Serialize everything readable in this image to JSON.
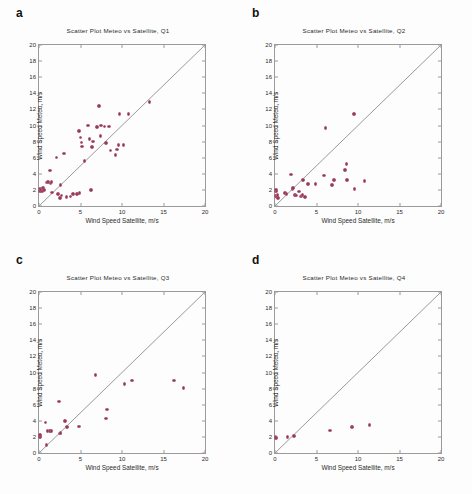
{
  "figure": {
    "name": "four-panel-scatter-figure",
    "marker_color": "#8e3a55",
    "axis_color": "#9a9a9a",
    "background": "#ffffff"
  },
  "axes_common": {
    "xlabel": "Wind Speed Satellite, m/s",
    "ylabel": "Wind Speed Meteo, m/s",
    "xlim": [
      0,
      20
    ],
    "ylim": [
      0,
      20
    ],
    "xticks": [
      "0",
      "5",
      "10",
      "15",
      "20"
    ],
    "xtick_values": [
      0,
      5,
      10,
      15,
      20
    ],
    "yticks": [
      "0",
      "2",
      "4",
      "6",
      "8",
      "10",
      "12",
      "14",
      "16",
      "18",
      "20"
    ],
    "ytick_values": [
      0,
      2,
      4,
      6,
      8,
      10,
      12,
      14,
      16,
      18,
      20
    ],
    "grid": false,
    "reference_line": "1:1 diagonal from (0,0) to (20,20)",
    "legend": "none"
  },
  "panels": [
    {
      "letter": "a",
      "title": "Scatter Plot Meteo  vs  Satellite,  Q1"
    },
    {
      "letter": "b",
      "title": "Scatter Plot Meteo  vs  Satellite,  Q2"
    },
    {
      "letter": "c",
      "title": "Scatter Plot Meteo  vs  Satellite,  Q3"
    },
    {
      "letter": "d",
      "title": "Scatter Plot Meteo  vs  Satellite,  Q4"
    }
  ],
  "chart_data": [
    {
      "type": "scatter",
      "panel": "a",
      "title": "Scatter Plot Meteo  vs  Satellite,  Q1",
      "xlabel": "Wind Speed Satellite, m/s",
      "ylabel": "Wind Speed Meteo, m/s",
      "xlim": [
        0,
        20
      ],
      "ylim": [
        0,
        20
      ],
      "grid": false,
      "legend_position": "none",
      "series": [
        {
          "name": "Q1 observations",
          "color": "#8e3a55",
          "x": [
            0.1,
            0.15,
            0.2,
            0.35,
            0.5,
            0.6,
            0.9,
            1.1,
            1.3,
            1.4,
            1.5,
            1.6,
            2.1,
            2.3,
            2.5,
            2.6,
            2.7,
            3.0,
            3.3,
            3.8,
            4.1,
            4.6,
            4.8,
            4.9,
            5.0,
            5.1,
            5.2,
            5.5,
            5.9,
            6.1,
            6.3,
            6.4,
            6.5,
            7.0,
            7.2,
            7.4,
            7.5,
            7.9,
            8.1,
            8.4,
            8.6,
            9.2,
            9.4,
            9.6,
            9.7,
            10.2,
            10.8,
            13.3
          ],
          "y": [
            1.9,
            2.1,
            2.0,
            1.8,
            2.2,
            2.0,
            2.9,
            3.0,
            4.4,
            2.8,
            3.0,
            1.7,
            6.0,
            1.5,
            1.0,
            2.6,
            1.3,
            6.5,
            1.1,
            1.2,
            1.5,
            1.5,
            9.3,
            1.6,
            8.5,
            7.9,
            7.4,
            5.6,
            10.0,
            8.3,
            2.0,
            7.3,
            8.0,
            9.8,
            12.4,
            8.7,
            10.0,
            9.9,
            7.8,
            9.9,
            6.9,
            6.3,
            7.0,
            7.6,
            11.4,
            7.6,
            11.4,
            12.9
          ]
        }
      ]
    },
    {
      "type": "scatter",
      "panel": "b",
      "title": "Scatter Plot Meteo  vs  Satellite,  Q2",
      "xlabel": "Wind Speed Satellite, m/s",
      "ylabel": "Wind Speed Meteo, m/s",
      "xlim": [
        0,
        20
      ],
      "ylim": [
        0,
        20
      ],
      "grid": false,
      "legend_position": "none",
      "series": [
        {
          "name": "Q2 observations",
          "color": "#8e3a55",
          "x": [
            0.05,
            0.1,
            0.12,
            0.15,
            0.2,
            0.25,
            0.3,
            0.35,
            1.2,
            1.4,
            1.9,
            2.1,
            2.2,
            2.4,
            2.5,
            2.9,
            3.1,
            3.2,
            3.3,
            3.4,
            3.6,
            4.0,
            4.9,
            5.9,
            6.1,
            6.9,
            7.1,
            8.4,
            8.6,
            8.7,
            9.5,
            9.6,
            10.8
          ],
          "y": [
            1.9,
            2.0,
            1.3,
            1.2,
            1.8,
            1.1,
            1.4,
            1.0,
            1.6,
            1.5,
            3.9,
            2.1,
            2.2,
            1.4,
            1.3,
            1.8,
            1.2,
            1.3,
            1.4,
            3.2,
            1.1,
            2.7,
            2.7,
            3.8,
            9.7,
            2.6,
            3.2,
            4.5,
            5.2,
            3.2,
            11.4,
            2.1,
            3.1
          ]
        }
      ]
    },
    {
      "type": "scatter",
      "panel": "c",
      "title": "Scatter Plot Meteo  vs  Satellite,  Q3",
      "xlabel": "Wind Speed Satellite, m/s",
      "ylabel": "Wind Speed Meteo, m/s",
      "xlim": [
        0,
        20
      ],
      "ylim": [
        0,
        20
      ],
      "grid": false,
      "legend_position": "none",
      "series": [
        {
          "name": "Q3 observations",
          "color": "#8e3a55",
          "x": [
            0.05,
            0.1,
            0.15,
            0.8,
            0.9,
            1.0,
            1.3,
            1.5,
            2.4,
            2.5,
            2.6,
            3.1,
            3.4,
            4.8,
            6.8,
            8.1,
            8.2,
            10.3,
            11.2,
            16.3,
            17.4
          ],
          "y": [
            2.1,
            2.0,
            2.2,
            3.8,
            1.0,
            2.7,
            2.7,
            2.7,
            6.4,
            2.4,
            2.5,
            4.0,
            3.2,
            3.3,
            9.7,
            4.3,
            5.4,
            8.6,
            9.0,
            9.0,
            8.1
          ]
        }
      ]
    },
    {
      "type": "scatter",
      "panel": "d",
      "title": "Scatter Plot Meteo  vs  Satellite,  Q4",
      "xlabel": "Wind Speed Satellite, m/s",
      "ylabel": "Wind Speed Meteo, m/s",
      "xlim": [
        0,
        20
      ],
      "ylim": [
        0,
        20
      ],
      "grid": false,
      "legend_position": "none",
      "series": [
        {
          "name": "Q4 observations",
          "color": "#8e3a55",
          "x": [
            0.05,
            0.1,
            1.5,
            2.3,
            6.6,
            9.3,
            11.4
          ],
          "y": [
            2.0,
            1.9,
            2.0,
            2.1,
            2.8,
            3.2,
            3.5
          ]
        }
      ]
    }
  ]
}
